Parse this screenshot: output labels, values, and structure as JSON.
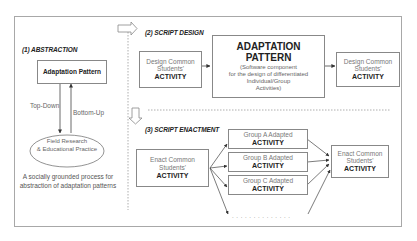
{
  "abstraction": {
    "title": "(1) ABSTRACTION",
    "pattern_box": "Adaptation Pattern",
    "top_down": "Top-Down",
    "bottom_up": "Bottom-Up",
    "ellipse_line1": "Field Research",
    "ellipse_line2": "& Educational Practice",
    "caption_line1": "A socially grounded process for",
    "caption_line2": "abstraction of adaptation patterns"
  },
  "script_design": {
    "title": "(2) SCRIPT DESIGN",
    "left_box": {
      "line1": "Design Common",
      "line2": "Students'",
      "bold": "ACTIVITY"
    },
    "center_box": {
      "title_line1": "ADAPTATION",
      "title_line2": "PATTERN",
      "desc_line1": "(Software component",
      "desc_line2": "for the design of differentiated",
      "desc_line3": "Individual/Group",
      "desc_line4": "Activities)"
    },
    "right_box": {
      "line1": "Design Common",
      "line2": "Students'",
      "bold": "ACTIVITY"
    }
  },
  "script_enactment": {
    "title": "(3) SCRIPT ENACTMENT",
    "left_box": {
      "line1": "Enact Common",
      "line2": "Students'",
      "bold": "ACTIVITY"
    },
    "groups": [
      {
        "line1": "Group A Adapted",
        "bold": "ACTIVITY"
      },
      {
        "line1": "Group B Adapted",
        "bold": "ACTIVITY"
      },
      {
        "line1": "Group C Adapted",
        "bold": "ACTIVITY"
      }
    ],
    "ellipsis": ". . . . . . . . . . . . . .",
    "right_box": {
      "line1": "Enact Common",
      "line2": "Students'",
      "bold": "ACTIVITY"
    }
  }
}
